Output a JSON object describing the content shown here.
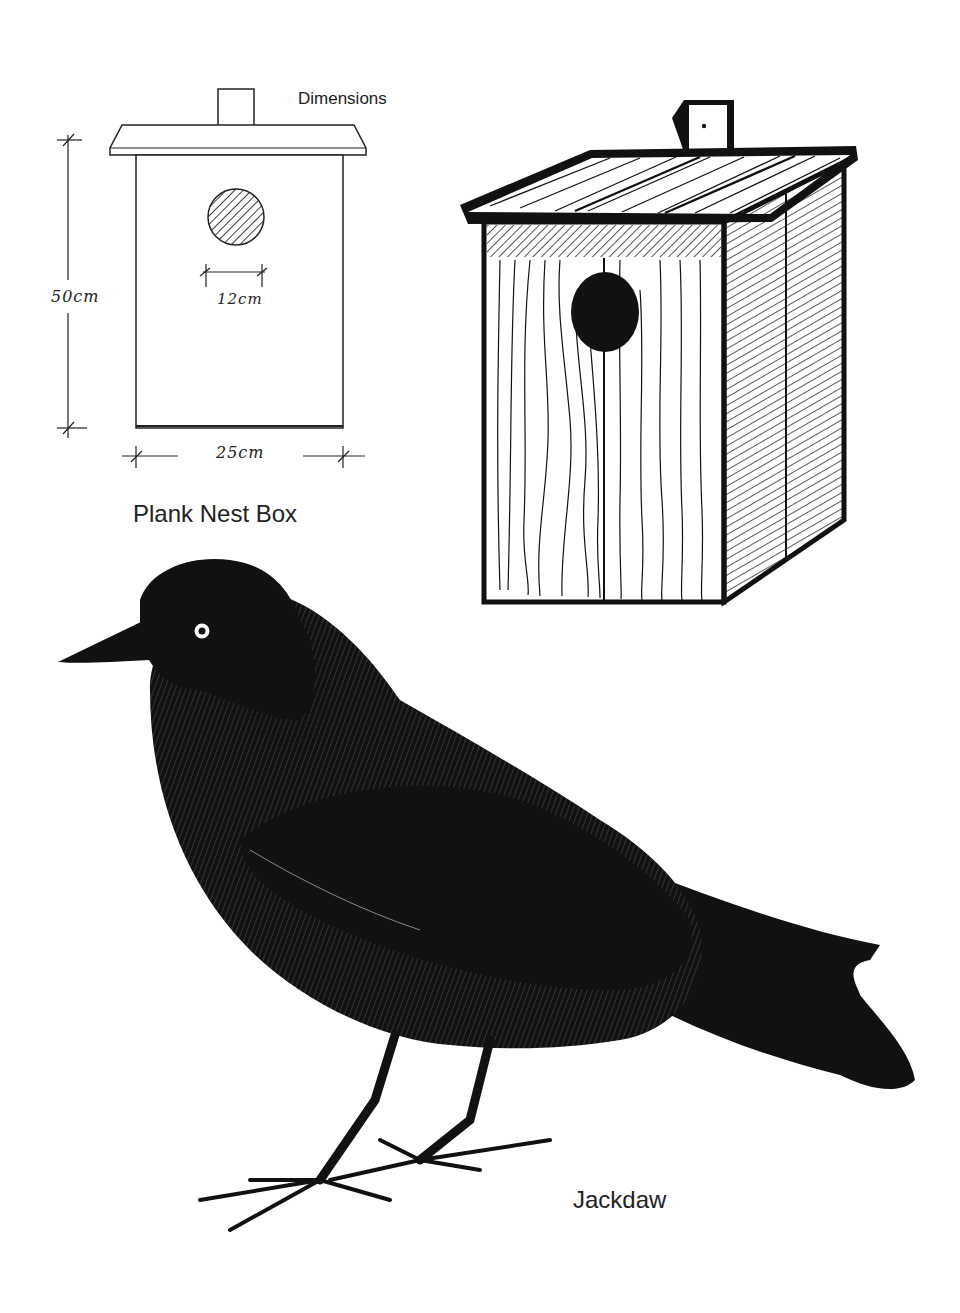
{
  "plan_diagram": {
    "heading": "Dimensions",
    "height_label": "50cm",
    "hole_label": "12cm",
    "width_label": "25cm",
    "caption": "Plank Nest Box"
  },
  "illustration": {
    "nest_box": "nest-box-perspective-drawing",
    "bird": "jackdaw-drawing",
    "bird_caption": "Jackdaw"
  },
  "colors": {
    "ink": "#111111",
    "paper": "#ffffff"
  }
}
